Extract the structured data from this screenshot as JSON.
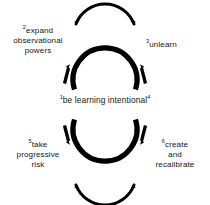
{
  "diagram": {
    "background_color": "#ffffff",
    "stroke_color": "#000000",
    "text_color": "#161616",
    "nodes": [
      {
        "id": "center",
        "number_before": "1",
        "number_after": "4",
        "text": "be learning intentional",
        "position": "center"
      },
      {
        "id": "expand",
        "number": "2",
        "text": "expand\nobservational\npowers",
        "position": "top-left"
      },
      {
        "id": "unlearn",
        "number": "3",
        "text": "unlearn",
        "position": "top-right"
      },
      {
        "id": "risk",
        "number": "5",
        "text": "take\nprogressive\nrisk",
        "position": "bottom-left"
      },
      {
        "id": "create",
        "number": "6",
        "text": "create\nand\nrecalibrate",
        "position": "bottom-right"
      }
    ],
    "shapes": {
      "top_circle": "circular-arrow-ring",
      "bottom_circle": "circular-arrow-ring",
      "top_outer_arc": "curved-arrow-arc",
      "bottom_outer_arc": "curved-arrow-arc"
    }
  }
}
